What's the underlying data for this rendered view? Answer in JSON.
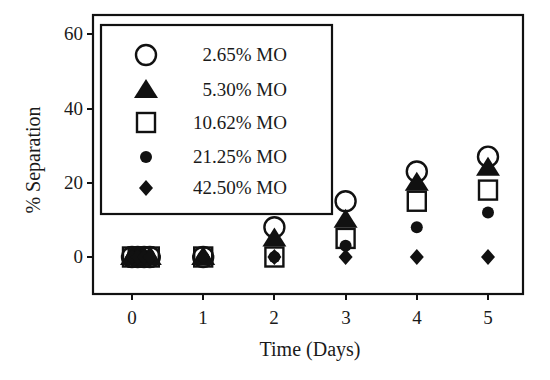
{
  "chart_data": {
    "type": "scatter",
    "title": "",
    "xlabel": "Time (Days)",
    "ylabel": "% Separation",
    "xlim": [
      -0.2,
      5.5
    ],
    "ylim": [
      -10,
      65
    ],
    "x_ticks": [
      "0",
      "1",
      "2",
      "3",
      "4",
      "5"
    ],
    "y_ticks": [
      "0",
      "20",
      "40",
      "60"
    ],
    "grid": false,
    "legend_position": "upper left (inside)",
    "x": [
      0,
      1,
      2,
      3,
      4,
      5
    ],
    "day0_replicate_x": [
      0,
      0.08,
      0.17,
      0.25
    ],
    "series": [
      {
        "name": "2.65% MO",
        "marker": "open-circle",
        "values": [
          0,
          0,
          8,
          15,
          23,
          27
        ]
      },
      {
        "name": "5.30% MO",
        "marker": "filled-triangle",
        "values": [
          0,
          0,
          5,
          10,
          20,
          24
        ]
      },
      {
        "name": "10.62% MO",
        "marker": "open-square",
        "values": [
          0,
          0,
          0,
          5,
          15,
          18
        ]
      },
      {
        "name": "21.25% MO",
        "marker": "filled-circle",
        "values": [
          0,
          0,
          0,
          3,
          8,
          12
        ]
      },
      {
        "name": "42.50% MO",
        "marker": "filled-diamond",
        "values": [
          0,
          0,
          0,
          0,
          0,
          0
        ]
      }
    ]
  },
  "legend": {
    "items": [
      "2.65% MO",
      "5.30% MO",
      "10.62% MO",
      "21.25% MO",
      "42.50% MO"
    ]
  },
  "axes": {
    "xlabel": "Time (Days)",
    "ylabel": "% Separation",
    "xticks": [
      "0",
      "1",
      "2",
      "3",
      "4",
      "5"
    ],
    "yticks": [
      "0",
      "20",
      "40",
      "60"
    ]
  }
}
